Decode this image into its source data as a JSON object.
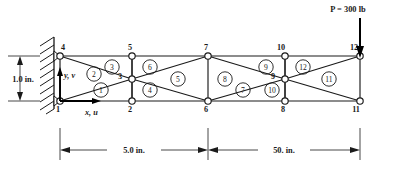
{
  "figure": {
    "type": "finite-element-truss-diagram",
    "load": {
      "label": "P = 300 lb",
      "magnitude": 300,
      "units": "lb",
      "applied_at_node": 12,
      "direction": "downward"
    },
    "dimensions": {
      "height_label": "1.0 in.",
      "span_left_label": "5.0 in.",
      "span_right_label": "50. in."
    },
    "axes": {
      "y_label": "y, v",
      "x_label": "x, u"
    },
    "support": {
      "type": "fixed-wall",
      "nodes": [
        1,
        4
      ]
    },
    "nodes": [
      {
        "id": 1,
        "label": "1",
        "x": 60,
        "y": 101,
        "label_dx": -2,
        "label_dy": 11
      },
      {
        "id": 2,
        "label": "2",
        "x": 132,
        "y": 101,
        "label_dx": -2,
        "label_dy": 11
      },
      {
        "id": 3,
        "label": "3",
        "x": 132,
        "y": 79,
        "label_dx": -12,
        "label_dy": 0
      },
      {
        "id": 4,
        "label": "4",
        "x": 60,
        "y": 56,
        "label_dx": 3,
        "label_dy": -6
      },
      {
        "id": 5,
        "label": "5",
        "x": 132,
        "y": 56,
        "label_dx": -2,
        "label_dy": -6
      },
      {
        "id": 6,
        "label": "6",
        "x": 208,
        "y": 101,
        "label_dx": -2,
        "label_dy": 11
      },
      {
        "id": 7,
        "label": "7",
        "x": 208,
        "y": 56,
        "label_dx": -2,
        "label_dy": -6
      },
      {
        "id": 8,
        "label": "8",
        "x": 285,
        "y": 101,
        "label_dx": -2,
        "label_dy": 11
      },
      {
        "id": 9,
        "label": "9",
        "x": 285,
        "y": 79,
        "label_dx": -12,
        "label_dy": 0
      },
      {
        "id": 10,
        "label": "10",
        "x": 285,
        "y": 56,
        "label_dx": -4,
        "label_dy": -6
      },
      {
        "id": 11,
        "label": "11",
        "x": 360,
        "y": 101,
        "label_dx": -4,
        "label_dy": 11
      },
      {
        "id": 12,
        "label": "12",
        "x": 360,
        "y": 56,
        "label_dx": -6,
        "label_dy": -6
      }
    ],
    "members": [
      {
        "from": 1,
        "to": 2
      },
      {
        "from": 2,
        "to": 6
      },
      {
        "from": 6,
        "to": 8
      },
      {
        "from": 8,
        "to": 11
      },
      {
        "from": 4,
        "to": 5
      },
      {
        "from": 5,
        "to": 7
      },
      {
        "from": 7,
        "to": 10
      },
      {
        "from": 10,
        "to": 12
      },
      {
        "from": 1,
        "to": 4
      },
      {
        "from": 1,
        "to": 3
      },
      {
        "from": 2,
        "to": 3
      },
      {
        "from": 3,
        "to": 4
      },
      {
        "from": 3,
        "to": 5
      },
      {
        "from": 2,
        "to": 5
      },
      {
        "from": 3,
        "to": 6
      },
      {
        "from": 3,
        "to": 7
      },
      {
        "from": 6,
        "to": 7
      },
      {
        "from": 6,
        "to": 9
      },
      {
        "from": 7,
        "to": 9
      },
      {
        "from": 8,
        "to": 9
      },
      {
        "from": 9,
        "to": 10
      },
      {
        "from": 8,
        "to": 10
      },
      {
        "from": 9,
        "to": 11
      },
      {
        "from": 9,
        "to": 12
      },
      {
        "from": 11,
        "to": 12
      }
    ],
    "elements": [
      {
        "id": 1,
        "label": "1",
        "x": 101,
        "y": 90
      },
      {
        "id": 2,
        "label": "2",
        "x": 94,
        "y": 74
      },
      {
        "id": 3,
        "label": "3",
        "x": 112,
        "y": 67
      },
      {
        "id": 4,
        "label": "4",
        "x": 150,
        "y": 90
      },
      {
        "id": 5,
        "label": "5",
        "x": 178,
        "y": 79
      },
      {
        "id": 6,
        "label": "6",
        "x": 150,
        "y": 67
      },
      {
        "id": 7,
        "label": "7",
        "x": 243,
        "y": 90
      },
      {
        "id": 8,
        "label": "8",
        "x": 225,
        "y": 79
      },
      {
        "id": 9,
        "label": "9",
        "x": 266,
        "y": 67
      },
      {
        "id": 10,
        "label": "10",
        "x": 272,
        "y": 90
      },
      {
        "id": 11,
        "label": "11",
        "x": 329,
        "y": 79
      },
      {
        "id": 12,
        "label": "12",
        "x": 303,
        "y": 67
      }
    ]
  }
}
